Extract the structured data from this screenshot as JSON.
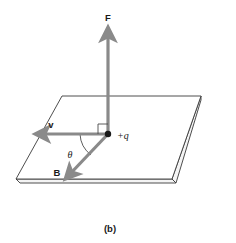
{
  "figure": {
    "caption": "(b)",
    "background_color": "#ffffff"
  },
  "plane": {
    "name": "horizontal-plane",
    "stroke_color": "#3a3a3a",
    "fill_color": "#ffffff",
    "corners": [
      {
        "x": 62,
        "y": 96
      },
      {
        "x": 201,
        "y": 96
      },
      {
        "x": 172,
        "y": 179
      },
      {
        "x": 16,
        "y": 179
      }
    ],
    "slab_depth": 4
  },
  "vectors": [
    {
      "id": "force",
      "label": "F",
      "label_x": 108,
      "label_y": 20,
      "color": "#8a8a8a",
      "from": {
        "x": 108,
        "y": 133
      },
      "to": {
        "x": 108,
        "y": 31
      },
      "width": 3.2
    },
    {
      "id": "velocity",
      "label": "v",
      "label_x": 51,
      "label_y": 127,
      "color": "#8a8a8a",
      "from": {
        "x": 108,
        "y": 134
      },
      "to": {
        "x": 39,
        "y": 134
      },
      "width": 3.2
    },
    {
      "id": "magnetic-field",
      "label": "B",
      "label_x": 56,
      "label_y": 174,
      "color": "#8a8a8a",
      "from": {
        "x": 108,
        "y": 134
      },
      "to": {
        "x": 67,
        "y": 177
      },
      "width": 3.2
    }
  ],
  "charge": {
    "label": "+q",
    "label_x": 118,
    "label_y": 139,
    "dot_x": 108,
    "dot_y": 134,
    "dot_radius": 3.2,
    "dot_color": "#1a1a1a"
  },
  "angle": {
    "symbol": "θ",
    "label_x": 69,
    "label_y": 156,
    "arc_color": "#4a4a4a"
  },
  "right_angle_marker": {
    "name": "right-angle-marker",
    "color": "#4a4a4a",
    "size": 9
  }
}
